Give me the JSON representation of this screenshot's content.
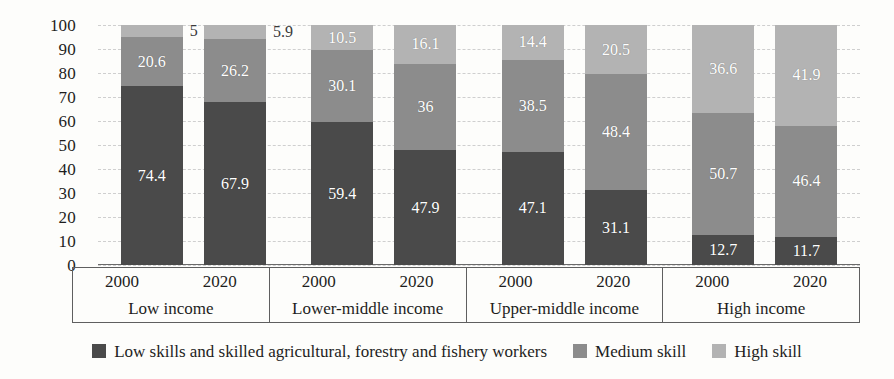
{
  "chart_data": {
    "type": "bar",
    "subtype": "stacked-100-percent",
    "title": "",
    "xlabel": "",
    "ylabel": "",
    "ylim": [
      0,
      100
    ],
    "yticks": [
      100,
      90,
      80,
      70,
      60,
      50,
      40,
      30,
      20,
      10,
      0
    ],
    "grid": true,
    "legend_position": "bottom",
    "groups": [
      "Low income",
      "Lower-middle income",
      "Upper-middle income",
      "High income"
    ],
    "x": [
      "2000",
      "2020",
      "2000",
      "2020",
      "2000",
      "2020",
      "2000",
      "2020"
    ],
    "categories": [
      "Low income 2000",
      "Low income 2020",
      "Lower-middle income 2000",
      "Lower-middle income 2020",
      "Upper-middle income 2000",
      "Upper-middle income 2020",
      "High income 2000",
      "High income 2020"
    ],
    "series": [
      {
        "name": "Low skills and skilled agricultural, forestry and fishery workers",
        "color": "#4a4a4a",
        "values": [
          74.4,
          67.9,
          59.4,
          47.9,
          47.1,
          31.1,
          12.7,
          11.7
        ],
        "labels": [
          "74.4",
          "67.9",
          "59.4",
          "47.9",
          "47.1",
          "31.1",
          "12.7",
          "11.7"
        ]
      },
      {
        "name": "Medium skill",
        "color": "#8c8c8c",
        "values": [
          20.6,
          26.2,
          30.1,
          36,
          38.5,
          48.4,
          50.7,
          46.4
        ],
        "labels": [
          "20.6",
          "26.2",
          "30.1",
          "36",
          "38.5",
          "48.4",
          "50.7",
          "46.4"
        ]
      },
      {
        "name": "High skill",
        "color": "#b3b3b3",
        "values": [
          5,
          5.9,
          10.5,
          16.1,
          14.4,
          20.5,
          36.6,
          41.9
        ],
        "labels": [
          "5",
          "5.9",
          "10.5",
          "16.1",
          "14.4",
          "20.5",
          "36.6",
          "41.9"
        ]
      }
    ]
  },
  "axis": {
    "yticks": [
      "100",
      "90",
      "80",
      "70",
      "60",
      "50",
      "40",
      "30",
      "20",
      "10",
      "0"
    ],
    "groups": [
      {
        "name": "Low income",
        "years": [
          "2000",
          "2020"
        ]
      },
      {
        "name": "Lower-middle income",
        "years": [
          "2000",
          "2020"
        ]
      },
      {
        "name": "Upper-middle income",
        "years": [
          "2000",
          "2020"
        ]
      },
      {
        "name": "High income",
        "years": [
          "2000",
          "2020"
        ]
      }
    ]
  },
  "legend": {
    "items": [
      {
        "label": "Low skills and skilled agricultural, forestry and fishery workers",
        "color": "#4a4a4a",
        "swatch": "legend-swatch-low-skill"
      },
      {
        "label": "Medium skill",
        "color": "#8c8c8c",
        "swatch": "legend-swatch-medium-skill"
      },
      {
        "label": "High skill",
        "color": "#b3b3b3",
        "swatch": "legend-swatch-high-skill"
      }
    ]
  },
  "style": {
    "background": "#fdfdfb",
    "text_color": "#1d1d1d",
    "grid_color": "#cfcfcf",
    "axis_color": "#5f5f5f",
    "label_color_inside": "#ffffff",
    "label_color_outside": "#3a3a3a"
  }
}
